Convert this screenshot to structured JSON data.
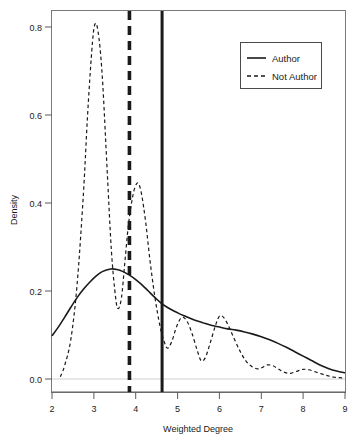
{
  "chart_data": {
    "type": "line",
    "title": "",
    "xlabel": "Weighted Degree",
    "ylabel": "Density",
    "xlim": [
      2,
      9
    ],
    "ylim": [
      0.0,
      0.85
    ],
    "xticks": [
      2,
      3,
      4,
      5,
      6,
      7,
      8,
      9
    ],
    "xtick_labels": [
      "2",
      "3",
      "4",
      "5",
      "6",
      "7",
      "8",
      "9"
    ],
    "yticks": [
      0.0,
      0.2,
      0.4,
      0.6,
      0.8
    ],
    "ytick_labels": [
      "0.0",
      "0.2",
      "0.4",
      "0.6",
      "0.8"
    ],
    "grid": false,
    "legend_position": "top-right",
    "legend_entries": [
      "Author",
      "Not Author"
    ],
    "series": [
      {
        "name": "Author",
        "style": "solid",
        "color": "#1a1a1a",
        "x": [
          2.0,
          2.15,
          2.3,
          2.45,
          2.6,
          2.75,
          2.9,
          3.05,
          3.2,
          3.4,
          3.55,
          3.7,
          3.85,
          4.0,
          4.15,
          4.3,
          4.45,
          4.6,
          4.75,
          4.9,
          5.05,
          5.2,
          5.4,
          5.6,
          5.8,
          6.0,
          6.2,
          6.4,
          6.6,
          6.8,
          7.0,
          7.2,
          7.4,
          7.6,
          7.8,
          8.0,
          8.2,
          8.4,
          8.6,
          8.8,
          9.0
        ],
        "y": [
          0.098,
          0.118,
          0.14,
          0.163,
          0.185,
          0.204,
          0.22,
          0.234,
          0.244,
          0.25,
          0.249,
          0.244,
          0.236,
          0.226,
          0.214,
          0.2,
          0.186,
          0.173,
          0.163,
          0.155,
          0.148,
          0.142,
          0.134,
          0.128,
          0.122,
          0.118,
          0.114,
          0.111,
          0.107,
          0.102,
          0.096,
          0.089,
          0.081,
          0.072,
          0.062,
          0.052,
          0.042,
          0.032,
          0.024,
          0.018,
          0.014
        ]
      },
      {
        "name": "Not Author",
        "style": "dashed",
        "color": "#1a1a1a",
        "x": [
          2.2,
          2.3,
          2.45,
          2.6,
          2.75,
          2.85,
          2.95,
          3.02,
          3.1,
          3.2,
          3.32,
          3.42,
          3.52,
          3.58,
          3.66,
          3.74,
          3.82,
          3.9,
          3.98,
          4.06,
          4.14,
          4.24,
          4.34,
          4.46,
          4.58,
          4.68,
          4.76,
          4.86,
          4.98,
          5.1,
          5.22,
          5.34,
          5.46,
          5.56,
          5.66,
          5.78,
          5.9,
          6.0,
          6.1,
          6.22,
          6.36,
          6.5,
          6.64,
          6.78,
          6.92,
          7.02,
          7.14,
          7.28,
          7.42,
          7.56,
          7.7,
          7.86,
          8.0,
          8.14,
          8.3,
          8.46,
          8.6,
          8.75,
          8.88,
          9.0
        ],
        "y": [
          0.005,
          0.03,
          0.09,
          0.215,
          0.42,
          0.6,
          0.745,
          0.805,
          0.79,
          0.69,
          0.47,
          0.29,
          0.185,
          0.16,
          0.185,
          0.265,
          0.345,
          0.4,
          0.435,
          0.445,
          0.42,
          0.355,
          0.27,
          0.185,
          0.12,
          0.085,
          0.07,
          0.085,
          0.12,
          0.14,
          0.132,
          0.105,
          0.068,
          0.042,
          0.048,
          0.082,
          0.12,
          0.143,
          0.14,
          0.12,
          0.09,
          0.062,
          0.04,
          0.028,
          0.023,
          0.026,
          0.032,
          0.03,
          0.022,
          0.015,
          0.013,
          0.018,
          0.022,
          0.021,
          0.016,
          0.011,
          0.007,
          0.004,
          0.003,
          0.002
        ]
      }
    ],
    "reference_lines": [
      {
        "name": "not-author-mean",
        "x": 3.85,
        "style": "dashed",
        "width": 3.6,
        "color": "#1a1a1a"
      },
      {
        "name": "author-mean",
        "x": 4.63,
        "style": "solid",
        "width": 3.0,
        "color": "#1a1a1a"
      }
    ],
    "baseline": {
      "y": 0.0,
      "color": "#cccccc"
    }
  }
}
